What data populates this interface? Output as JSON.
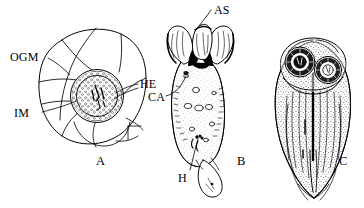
{
  "figure": {
    "kind": "scientific-line-drawing",
    "background_color": "#ffffff",
    "ink_color": "#000000",
    "width": 364,
    "height": 208,
    "caption_letters": [
      {
        "key": "A",
        "label": "A"
      },
      {
        "key": "B",
        "label": "B"
      },
      {
        "key": "C",
        "label": "C"
      }
    ],
    "labels": [
      {
        "key": "OGM",
        "label": "OGM",
        "panel": "A"
      },
      {
        "key": "IM",
        "label": "IM",
        "panel": "A"
      },
      {
        "key": "HE",
        "label": "HE",
        "panel": "A"
      },
      {
        "key": "CA",
        "label": "CA",
        "panel": "B"
      },
      {
        "key": "AS",
        "label": "AS",
        "panel": "B"
      },
      {
        "key": "H",
        "label": "H",
        "panel": "B"
      }
    ],
    "panels": [
      {
        "letter": "A",
        "name": "egg-with-membranes",
        "features": [
          "OGM",
          "IM",
          "HE"
        ]
      },
      {
        "letter": "B",
        "name": "hatched-larva",
        "features": [
          "AS",
          "CA",
          "H"
        ]
      },
      {
        "letter": "C",
        "name": "developed-larva",
        "features": []
      }
    ]
  }
}
